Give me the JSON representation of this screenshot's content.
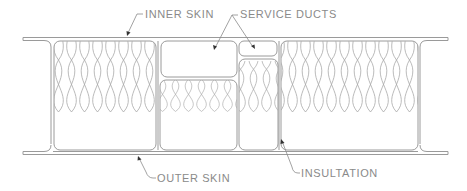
{
  "diagram": {
    "colors": {
      "line": "#9a9a9a",
      "text": "#8a8a8a",
      "background": "#ffffff"
    },
    "labels": {
      "inner_skin": "INNER SKIN",
      "service_ducts": "SERVICE DUCTS",
      "outer_skin": "OUTER SKIN",
      "insulation": "INSULTATION"
    },
    "components": [
      {
        "name": "inner-skin",
        "type": "skin-line"
      },
      {
        "name": "outer-skin",
        "type": "skin-line"
      },
      {
        "name": "large-service-duct",
        "type": "duct"
      },
      {
        "name": "small-service-duct",
        "type": "duct"
      },
      {
        "name": "insulation-left",
        "type": "insulation"
      },
      {
        "name": "insulation-center-left",
        "type": "insulation"
      },
      {
        "name": "insulation-center-right",
        "type": "insulation"
      },
      {
        "name": "insulation-right",
        "type": "insulation"
      }
    ]
  }
}
